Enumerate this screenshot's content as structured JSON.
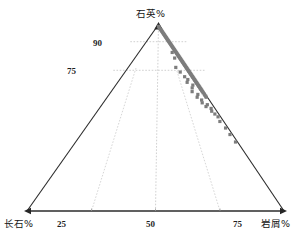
{
  "figure": {
    "type": "ternary-diagram",
    "title": "",
    "background_color": "#ffffff"
  },
  "labels": {
    "apex": "石英%",
    "bottom_left": "长石%",
    "bottom_right": "岩屑%"
  },
  "ticks": {
    "bottom": [
      "25",
      "50",
      "75"
    ],
    "left": [
      "90",
      "75"
    ]
  },
  "colors": {
    "axis": "#2b2b2b",
    "grid": "#c9c9c9",
    "marker": "#7d7d7d",
    "marker_edge": "#6a6a6a",
    "text": "#141414"
  },
  "chart_data": {
    "type": "scatter",
    "title": "",
    "xlabel": "岩屑%",
    "ylabel": "石英%",
    "axes": [
      "石英%",
      "长石%",
      "岩屑%"
    ],
    "axis_ranges": {
      "quartz": [
        0,
        100
      ],
      "feldspar": [
        0,
        100
      ],
      "lithic": [
        0,
        100
      ]
    },
    "grid": true,
    "gridlines": {
      "quartz_levels": [
        90,
        75
      ],
      "lithic_levels": [
        25,
        50,
        75
      ],
      "feldspar_levels": []
    },
    "legend": null,
    "marker": {
      "shape": "square",
      "color": "#7d7d7d",
      "size": 3.2
    },
    "point_count": 118,
    "series": [
      {
        "name": "样品",
        "axis_order": [
          "quartz",
          "feldspar",
          "lithic"
        ],
        "points": [
          [
            99.0,
            0.5,
            0.5
          ],
          [
            98.5,
            0.5,
            1.0
          ],
          [
            98.0,
            0.6,
            1.4
          ],
          [
            97.6,
            0.5,
            1.9
          ],
          [
            97.2,
            0.5,
            2.3
          ],
          [
            96.8,
            0.4,
            2.8
          ],
          [
            96.4,
            0.5,
            3.1
          ],
          [
            96.0,
            0.4,
            3.6
          ],
          [
            95.6,
            0.5,
            3.9
          ],
          [
            95.2,
            0.4,
            4.4
          ],
          [
            94.8,
            0.5,
            4.7
          ],
          [
            94.4,
            0.4,
            5.2
          ],
          [
            94.0,
            0.5,
            5.5
          ],
          [
            93.6,
            0.4,
            6.0
          ],
          [
            93.2,
            0.5,
            6.3
          ],
          [
            92.8,
            0.4,
            6.8
          ],
          [
            92.4,
            0.5,
            7.1
          ],
          [
            92.0,
            0.4,
            7.6
          ],
          [
            91.6,
            0.5,
            7.9
          ],
          [
            91.2,
            0.4,
            8.4
          ],
          [
            90.8,
            0.5,
            8.7
          ],
          [
            90.4,
            0.4,
            9.2
          ],
          [
            90.0,
            0.5,
            9.5
          ],
          [
            89.6,
            0.4,
            10.0
          ],
          [
            89.2,
            0.5,
            10.3
          ],
          [
            88.8,
            0.4,
            10.8
          ],
          [
            88.4,
            0.5,
            11.1
          ],
          [
            88.0,
            0.4,
            11.6
          ],
          [
            87.6,
            0.5,
            11.9
          ],
          [
            87.2,
            0.4,
            12.4
          ],
          [
            86.8,
            0.5,
            12.7
          ],
          [
            86.4,
            0.4,
            13.2
          ],
          [
            86.0,
            0.5,
            13.5
          ],
          [
            85.6,
            0.4,
            14.0
          ],
          [
            85.2,
            0.5,
            14.3
          ],
          [
            84.8,
            0.4,
            14.8
          ],
          [
            84.4,
            0.5,
            15.1
          ],
          [
            84.0,
            0.4,
            15.6
          ],
          [
            83.6,
            0.5,
            15.9
          ],
          [
            83.2,
            0.4,
            16.4
          ],
          [
            82.8,
            0.5,
            16.7
          ],
          [
            82.4,
            0.4,
            17.2
          ],
          [
            82.0,
            0.5,
            17.5
          ],
          [
            81.6,
            0.4,
            18.0
          ],
          [
            81.2,
            0.5,
            18.3
          ],
          [
            80.8,
            0.4,
            18.8
          ],
          [
            80.4,
            0.5,
            19.1
          ],
          [
            80.0,
            0.4,
            19.6
          ],
          [
            79.6,
            0.5,
            19.9
          ],
          [
            79.2,
            0.4,
            20.4
          ],
          [
            78.8,
            0.5,
            20.7
          ],
          [
            78.4,
            0.4,
            21.2
          ],
          [
            78.0,
            0.5,
            21.5
          ],
          [
            77.6,
            0.4,
            22.0
          ],
          [
            77.2,
            0.5,
            22.3
          ],
          [
            76.8,
            0.4,
            22.8
          ],
          [
            76.4,
            0.5,
            23.1
          ],
          [
            76.0,
            0.4,
            23.6
          ],
          [
            75.6,
            0.5,
            23.9
          ],
          [
            75.2,
            0.4,
            24.4
          ],
          [
            74.8,
            0.5,
            24.7
          ],
          [
            74.4,
            0.4,
            25.2
          ],
          [
            74.0,
            0.5,
            25.5
          ],
          [
            73.6,
            0.4,
            26.0
          ],
          [
            73.2,
            0.5,
            26.3
          ],
          [
            72.8,
            0.4,
            26.8
          ],
          [
            72.4,
            0.5,
            27.1
          ],
          [
            72.0,
            0.4,
            27.6
          ],
          [
            71.6,
            0.5,
            27.9
          ],
          [
            71.2,
            0.4,
            28.4
          ],
          [
            70.8,
            0.5,
            28.7
          ],
          [
            70.4,
            0.4,
            29.2
          ],
          [
            70.0,
            0.5,
            29.5
          ],
          [
            69.6,
            0.4,
            30.0
          ],
          [
            69.2,
            0.5,
            30.3
          ],
          [
            68.8,
            0.4,
            30.8
          ],
          [
            68.4,
            0.5,
            31.1
          ],
          [
            68.0,
            0.4,
            31.6
          ],
          [
            67.6,
            0.5,
            31.9
          ],
          [
            67.2,
            0.4,
            32.4
          ],
          [
            66.8,
            0.5,
            32.7
          ],
          [
            66.4,
            0.4,
            33.2
          ],
          [
            66.0,
            0.5,
            33.5
          ],
          [
            65.6,
            0.4,
            34.0
          ],
          [
            65.2,
            0.5,
            34.3
          ],
          [
            64.8,
            0.4,
            34.8
          ],
          [
            64.4,
            0.5,
            35.1
          ],
          [
            64.0,
            0.4,
            35.6
          ],
          [
            63.4,
            0.5,
            36.1
          ],
          [
            62.8,
            0.4,
            36.8
          ],
          [
            62.2,
            0.5,
            37.3
          ],
          [
            61.6,
            0.4,
            38.0
          ],
          [
            61.0,
            0.5,
            38.5
          ],
          [
            77.0,
            4.5,
            18.5
          ],
          [
            74.5,
            4.0,
            21.5
          ],
          [
            72.0,
            3.5,
            24.5
          ],
          [
            70.5,
            3.0,
            26.5
          ],
          [
            69.0,
            4.0,
            27.0
          ],
          [
            67.5,
            2.5,
            30.0
          ],
          [
            66.0,
            3.5,
            30.5
          ],
          [
            64.0,
            4.5,
            31.5
          ],
          [
            62.5,
            3.0,
            34.5
          ],
          [
            61.0,
            4.0,
            35.0
          ],
          [
            59.5,
            3.0,
            37.5
          ],
          [
            58.0,
            3.5,
            38.5
          ],
          [
            57.0,
            2.0,
            41.0
          ],
          [
            56.0,
            3.0,
            41.0
          ],
          [
            55.0,
            1.5,
            43.5
          ],
          [
            53.5,
            2.0,
            44.5
          ],
          [
            52.0,
            1.5,
            46.5
          ],
          [
            50.5,
            1.0,
            48.5
          ],
          [
            48.0,
            1.5,
            50.5
          ],
          [
            44.5,
            1.0,
            54.5
          ],
          [
            41.0,
            1.0,
            58.0
          ],
          [
            37.0,
            0.8,
            62.2
          ],
          [
            82.0,
            2.5,
            15.5
          ],
          [
            85.0,
            2.0,
            13.0
          ]
        ]
      }
    ]
  }
}
